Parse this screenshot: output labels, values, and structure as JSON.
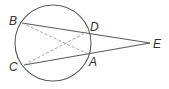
{
  "diagram": {
    "type": "circle with two secants from external point",
    "labels": {
      "B": "B",
      "D": "D",
      "E": "E",
      "C": "C",
      "A": "A"
    },
    "segments_solid": [
      "B-E",
      "C-E"
    ],
    "segments_dashed": [
      "B-A",
      "C-D"
    ],
    "colors": {
      "line": "#5a5a5a",
      "dashed": "#9a9a9a",
      "text": "#333333"
    }
  }
}
